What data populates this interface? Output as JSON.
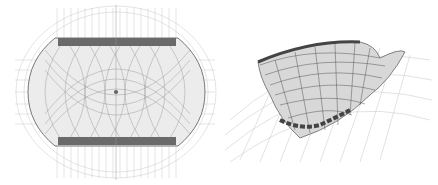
{
  "figure": {
    "panels": [
      {
        "id": "plan",
        "description": "stadium roof structural plan view",
        "label": ""
      },
      {
        "id": "perspective",
        "description": "stadium roof structural 3D perspective view",
        "label": ""
      }
    ],
    "colors": {
      "background": "#ffffff",
      "line_dark": "#555555",
      "line_mid": "#888888",
      "line_light": "#bbbbbb"
    }
  }
}
